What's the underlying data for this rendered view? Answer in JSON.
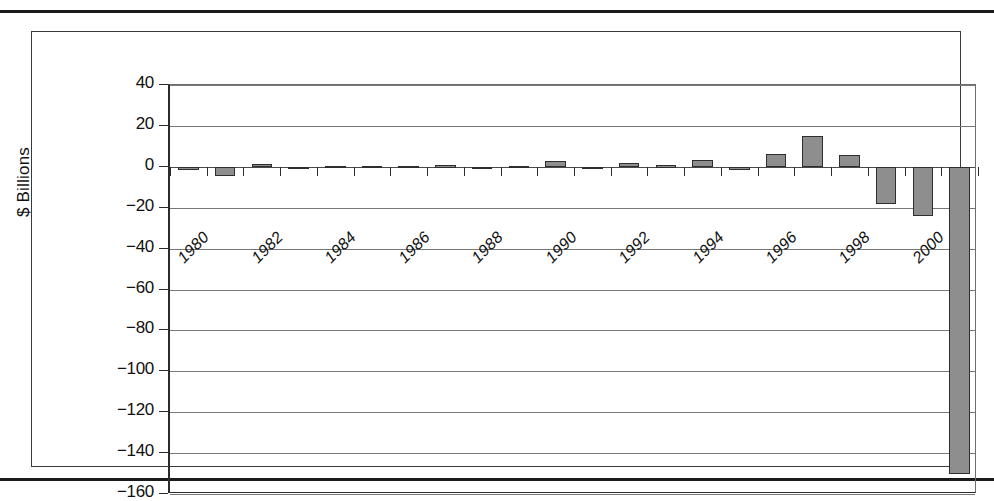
{
  "page": {
    "rule_top": "horizontal-rule",
    "rule_bottom": "horizontal-rule"
  },
  "chart_data": {
    "type": "bar",
    "title": "",
    "subtitle": "",
    "xlabel": "",
    "ylabel": "$ Billions",
    "ylim": [
      -160,
      40
    ],
    "ytick_step": 20,
    "grid": true,
    "legend": false,
    "bar_color": "#8e8e8e",
    "bar_border_color": "#2e2e2e",
    "xtick_labels": [
      "1980",
      "1982",
      "1984",
      "1986",
      "1988",
      "1990",
      "1992",
      "1994",
      "1996",
      "1998",
      "2000"
    ],
    "ytick_labels": [
      "40",
      "20",
      "0",
      "−20",
      "−40",
      "−60",
      "−80",
      "−100",
      "−120",
      "−140",
      "−160"
    ],
    "ytick_values": [
      40,
      20,
      0,
      -20,
      -40,
      -60,
      -80,
      -100,
      -120,
      -140,
      -160
    ],
    "categories": [
      "1980",
      "1981",
      "1982",
      "1983",
      "1984",
      "1985",
      "1986",
      "1987",
      "1988",
      "1989",
      "1990",
      "1991",
      "1992",
      "1993",
      "1994",
      "1995",
      "1996",
      "1997",
      "1998",
      "1999",
      "2000",
      "2001"
    ],
    "values": [
      -1.5,
      -4.5,
      1.5,
      -0.3,
      0.4,
      0.6,
      0.5,
      0.7,
      -1.0,
      0.6,
      3.0,
      -1.2,
      2.0,
      0.8,
      3.5,
      -1.8,
      6.5,
      15.0,
      6.0,
      -18.0,
      -24.0,
      -150.0
    ],
    "values_last": [
      -40.0
    ]
  }
}
